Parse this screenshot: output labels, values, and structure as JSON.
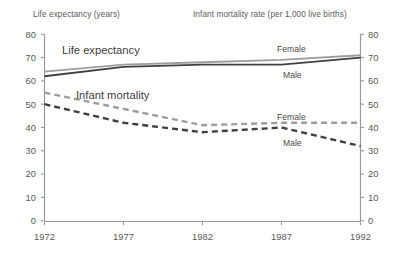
{
  "header": {
    "left_title": "Life expectancy (years)",
    "right_title": "Infant mortality rate (per 1,000 live births)"
  },
  "annotations": {
    "life_expectancy": "Life expectancy",
    "infant_mortality": "Infant mortality",
    "le_female": "Female",
    "le_male": "Male",
    "im_female": "Female",
    "im_male": "Male"
  },
  "axes": {
    "left_ticks": [
      "80",
      "70",
      "60",
      "50",
      "40",
      "30",
      "20",
      "10",
      "0"
    ],
    "right_ticks": [
      "80",
      "70",
      "60",
      "50",
      "40",
      "30",
      "20",
      "10",
      "0"
    ],
    "x_ticks": [
      "1972",
      "1977",
      "1982",
      "1987",
      "1992"
    ]
  },
  "colors": {
    "axis": "#9a9a9a",
    "text": "#4a4a4a",
    "female_line": "#9d9d9d",
    "male_line": "#404040"
  },
  "chart_data": {
    "type": "line",
    "title": "",
    "subtitle": "",
    "xlabel": "",
    "ylabel": "Life expectancy (years)",
    "y2label": "Infant mortality rate (per 1,000 live births)",
    "x": [
      1972,
      1977,
      1982,
      1987,
      1992
    ],
    "ylim": [
      0,
      80
    ],
    "y2lim": [
      0,
      80
    ],
    "yticks": [
      0,
      10,
      20,
      30,
      40,
      50,
      60,
      70,
      80
    ],
    "grid": false,
    "legend": "inline-annotations",
    "series": [
      {
        "name": "Life expectancy Female",
        "group": "Life expectancy",
        "axis": "left",
        "style": "solid",
        "color": "#9d9d9d",
        "values": [
          64,
          67,
          68,
          69,
          71
        ]
      },
      {
        "name": "Life expectancy Male",
        "group": "Life expectancy",
        "axis": "left",
        "style": "solid",
        "color": "#404040",
        "values": [
          62,
          66,
          67,
          67,
          70
        ]
      },
      {
        "name": "Infant mortality Female",
        "group": "Infant mortality",
        "axis": "right",
        "style": "dashed",
        "color": "#9d9d9d",
        "values": [
          55,
          48,
          41,
          42,
          42
        ]
      },
      {
        "name": "Infant mortality Male",
        "group": "Infant mortality",
        "axis": "right",
        "style": "dashed",
        "color": "#404040",
        "values": [
          50,
          42,
          38,
          40,
          32
        ]
      }
    ]
  }
}
